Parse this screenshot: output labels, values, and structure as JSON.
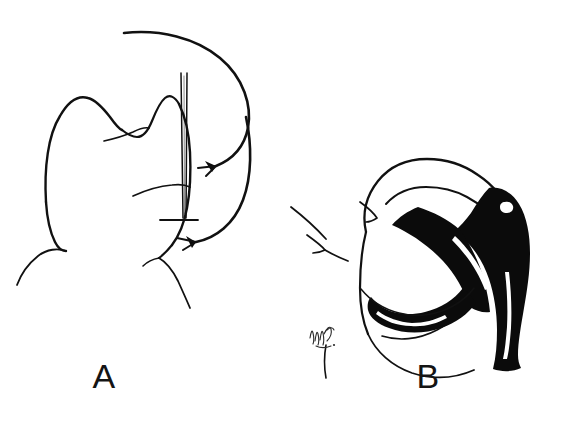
{
  "figure": {
    "domain_kind": "medical-line-illustration",
    "width": 582,
    "height": 421,
    "background_color": "#ffffff",
    "ink_color": "#111111",
    "fill_color": "#0b0b0b",
    "panel_count": 2
  },
  "panels": [
    {
      "id": "panel-a",
      "letter": "A",
      "letter_position": {
        "x": 104,
        "y": 388
      },
      "description": "Posterior view of head and neck with a straight needle/probe inserted vertically behind the ear, two curved directional arrows indicating approach direction",
      "elements": [
        {
          "name": "head-outline",
          "type": "contour"
        },
        {
          "name": "ear-contour",
          "type": "contour"
        },
        {
          "name": "neck-contour",
          "type": "contour"
        },
        {
          "name": "shoulder-contour-left",
          "type": "contour"
        },
        {
          "name": "shoulder-contour-right",
          "type": "contour"
        },
        {
          "name": "needle-probe",
          "type": "instrument"
        },
        {
          "name": "needle-crossbar",
          "type": "instrument-detail"
        },
        {
          "name": "arrow-upper",
          "type": "direction-arrow"
        },
        {
          "name": "arrow-lower",
          "type": "direction-arrow"
        }
      ]
    },
    {
      "id": "panel-b",
      "letter": "B",
      "letter_position": {
        "x": 428,
        "y": 388
      },
      "description": "Posterior view of head and neck with a black-filled flap / drain band curving from behind the ear down across the neck",
      "elements": [
        {
          "name": "head-outline",
          "type": "contour"
        },
        {
          "name": "ear-contour",
          "type": "contour"
        },
        {
          "name": "ear-mark-left",
          "type": "contour"
        },
        {
          "name": "ear-mark-right",
          "type": "contour"
        },
        {
          "name": "neck-contour",
          "type": "contour"
        },
        {
          "name": "shoulder-contour",
          "type": "contour"
        },
        {
          "name": "black-flap-band",
          "type": "filled-structure"
        },
        {
          "name": "black-flap-highlight",
          "type": "highlight"
        },
        {
          "name": "lower-black-band",
          "type": "filled-structure"
        },
        {
          "name": "artist-signature",
          "type": "signature"
        }
      ]
    }
  ],
  "labels": {
    "panel_a_letter": "A",
    "panel_b_letter": "B"
  },
  "colors": {
    "background": "#ffffff",
    "ink": "#111111",
    "fill": "#0b0b0b",
    "highlight": "#ffffff",
    "signature": "#2a2a2a"
  }
}
